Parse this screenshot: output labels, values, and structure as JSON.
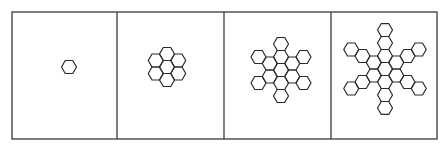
{
  "figure": {
    "border_color": "#3a3a3a",
    "stroke_color": "#2a2a2a",
    "background": "#ffffff",
    "frame": {
      "x": 12,
      "y": 12,
      "width": 425,
      "height": 127
    },
    "dividers_x": [
      117,
      224,
      331
    ],
    "hex_radius": 7.5,
    "panels": [
      {
        "name": "stage-1",
        "label": "Stage 1: single hexagon",
        "center": [
          69,
          67
        ],
        "hex_count": 1,
        "arm_length": 0,
        "ring": 0
      },
      {
        "name": "stage-2",
        "label": "Stage 2: seven-hexagon flower",
        "center": [
          167,
          67
        ],
        "hex_count": 7,
        "arm_length": 1,
        "ring": 1
      },
      {
        "name": "stage-3",
        "label": "Stage 3: flower with six arm tips",
        "center": [
          281,
          70
        ],
        "hex_count": 13,
        "arm_length": 2,
        "ring": 1
      },
      {
        "name": "stage-4",
        "label": "Stage 4: six-armed snowflake",
        "center": [
          385,
          69
        ],
        "hex_count": 19,
        "arm_length": 3,
        "ring": 1
      }
    ]
  }
}
